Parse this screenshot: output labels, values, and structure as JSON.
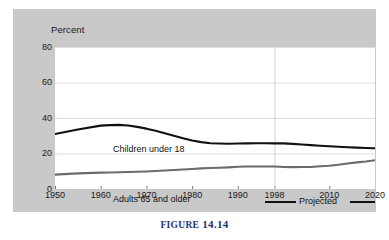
{
  "figure": {
    "caption_word": "Figure",
    "caption_number": "14.14"
  },
  "chart_data": {
    "type": "line",
    "title": "",
    "subtitle": "",
    "xlabel": "",
    "ylabel": "Percent",
    "ylim": [
      0,
      80
    ],
    "xlim": [
      1950,
      2020
    ],
    "yticks": [
      0,
      20,
      40,
      60,
      80
    ],
    "ytick_labels": [
      "0",
      "20",
      "40",
      "60",
      "80"
    ],
    "xticks": [
      1950,
      1960,
      1970,
      1980,
      1990,
      1998,
      2010,
      2020
    ],
    "xtick_labels": [
      "1950",
      "1960",
      "1970",
      "1980",
      "1990",
      "1998",
      "2010",
      "2020"
    ],
    "grid": "horizontal-gridlines-light-plus-projection-divider",
    "legend_position": "bottom-right",
    "legend": [
      {
        "label": "Projected",
        "marker": "line-rule-both-sides",
        "color": "#111111"
      }
    ],
    "annotations": [
      {
        "text": "Children under 18",
        "series": "Children under 18",
        "x": 1956,
        "y": 45
      },
      {
        "text": "Adults 65 and older",
        "series": "Adults 65 and older",
        "x": 1956,
        "y": 22
      }
    ],
    "projection_divider_year": 1998,
    "x": [
      1950,
      1955,
      1960,
      1962,
      1964,
      1966,
      1968,
      1970,
      1972,
      1974,
      1976,
      1978,
      1980,
      1982,
      1984,
      1986,
      1988,
      1990,
      1992,
      1994,
      1996,
      1998,
      2000,
      2002,
      2004,
      2006,
      2008,
      2010,
      2012,
      2014,
      2016,
      2018,
      2020
    ],
    "series": [
      {
        "name": "Children under 18",
        "color": "#111111",
        "values": [
          31.0,
          33.5,
          35.7,
          36.0,
          36.1,
          35.8,
          35.0,
          34.0,
          32.8,
          31.4,
          30.0,
          28.6,
          27.3,
          26.4,
          25.8,
          25.6,
          25.5,
          25.6,
          25.7,
          25.8,
          25.8,
          25.7,
          25.7,
          25.4,
          25.1,
          24.7,
          24.4,
          24.1,
          23.8,
          23.5,
          23.3,
          23.1,
          23.0
        ]
      },
      {
        "name": "Adults 65 and older",
        "color": "#6b6b6b",
        "values": [
          8.1,
          8.8,
          9.2,
          9.3,
          9.4,
          9.6,
          9.7,
          9.9,
          10.1,
          10.4,
          10.7,
          11.0,
          11.3,
          11.6,
          11.8,
          12.0,
          12.2,
          12.5,
          12.7,
          12.7,
          12.7,
          12.7,
          12.4,
          12.3,
          12.4,
          12.4,
          12.8,
          13.1,
          13.7,
          14.4,
          15.0,
          15.5,
          16.2
        ]
      }
    ]
  }
}
